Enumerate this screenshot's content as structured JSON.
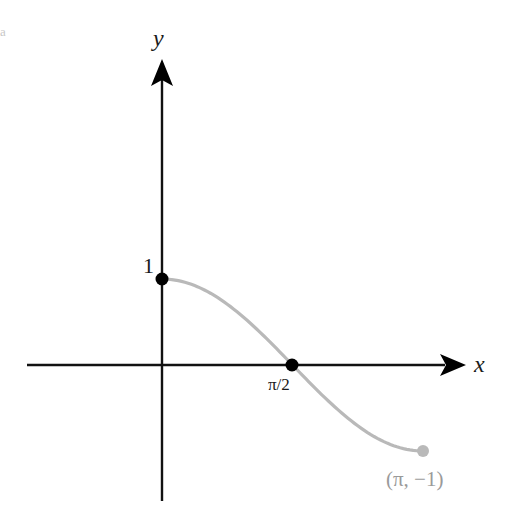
{
  "corner_mark": "a",
  "axes": {
    "x_label": "x",
    "y_label": "y"
  },
  "labels": {
    "y_one": "1",
    "x_half_pi": "π/2",
    "end_point": "(π, −1)"
  },
  "colors": {
    "axis": "#111111",
    "curve": "#b9b9b9",
    "marker": "#000000",
    "end_marker": "#b9b9b9",
    "end_label": "#9a9a9a"
  },
  "chart_data": {
    "type": "line",
    "title": "",
    "function": "y = cos(x)",
    "xlabel": "x",
    "ylabel": "y",
    "xlim": [
      0,
      3.14159
    ],
    "ylim": [
      -1,
      1
    ],
    "grid": false,
    "legend": null,
    "x_ticks": [
      {
        "value": 1.5708,
        "label": "π/2"
      }
    ],
    "y_ticks": [
      {
        "value": 1,
        "label": "1"
      }
    ],
    "points": [
      {
        "x": 0,
        "y": 1,
        "label": "1",
        "style": "filled-black"
      },
      {
        "x": 1.5708,
        "y": 0,
        "label": "π/2",
        "style": "filled-black"
      },
      {
        "x": 3.14159,
        "y": -1,
        "label": "(π, −1)",
        "style": "filled-gray"
      }
    ],
    "series": [
      {
        "name": "cos(x)",
        "x": [
          0,
          0.3927,
          0.7854,
          1.1781,
          1.5708,
          1.9635,
          2.3562,
          2.7489,
          3.14159
        ],
        "values": [
          1,
          0.9239,
          0.7071,
          0.3827,
          0,
          -0.3827,
          -0.7071,
          -0.9239,
          -1
        ]
      }
    ]
  }
}
